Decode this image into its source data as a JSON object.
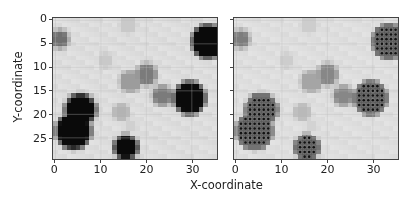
{
  "figure": {
    "xlabel": "X-coordinate",
    "ylabel": "Y-coordinate"
  },
  "chart_data": [
    {
      "type": "heatmap",
      "title": "",
      "xlabel": "X-coordinate",
      "ylabel": "Y-coordinate",
      "grid_shape": [
        30,
        36
      ],
      "xlim": [
        -0.5,
        35.5
      ],
      "ylim": [
        29.5,
        -0.5
      ],
      "xticks": [
        0,
        10,
        20,
        30
      ],
      "yticks": [
        0,
        5,
        10,
        15,
        20,
        25
      ],
      "colormap": "gray_r",
      "grid": true,
      "blobs": [
        {
          "x": 33.5,
          "y": 4.5,
          "radius": 3.0,
          "intensity": 1.0
        },
        {
          "x": 29.5,
          "y": 16.5,
          "radius": 2.9,
          "intensity": 1.0
        },
        {
          "x": 5.5,
          "y": 19.0,
          "radius": 2.8,
          "intensity": 1.0
        },
        {
          "x": 4.0,
          "y": 23.5,
          "radius": 3.3,
          "intensity": 1.0
        },
        {
          "x": 15.5,
          "y": 27.0,
          "radius": 2.0,
          "intensity": 1.0
        },
        {
          "x": 1.0,
          "y": 4.0,
          "radius": 1.3,
          "intensity": 0.55
        },
        {
          "x": 20.0,
          "y": 11.5,
          "radius": 1.7,
          "intensity": 0.5
        },
        {
          "x": 16.5,
          "y": 13.0,
          "radius": 1.8,
          "intensity": 0.35
        },
        {
          "x": 23.5,
          "y": 16.0,
          "radius": 1.6,
          "intensity": 0.5
        },
        {
          "x": 14.5,
          "y": 19.5,
          "radius": 1.4,
          "intensity": 0.25
        },
        {
          "x": 11.0,
          "y": 8.5,
          "radius": 1.3,
          "intensity": 0.15
        },
        {
          "x": 16.0,
          "y": 1.0,
          "radius": 1.5,
          "intensity": 0.15
        },
        {
          "x": 16.5,
          "y": 22.5,
          "radius": 1.0,
          "intensity": 0.12
        }
      ]
    },
    {
      "type": "heatmap",
      "title": "",
      "xlabel": "X-coordinate",
      "ylabel": "",
      "grid_shape": [
        30,
        36
      ],
      "xlim": [
        -0.5,
        35.5
      ],
      "ylim": [
        29.5,
        -0.5
      ],
      "xticks": [
        0,
        10,
        20,
        30
      ],
      "yticks": [
        0,
        5,
        10,
        15,
        20,
        25
      ],
      "ytick_labels_visible": false,
      "colormap": "gray_r (lightened)",
      "overlay": "dark dots marking high-value cells (threshold 0.55)",
      "grid": true
    }
  ],
  "left": {
    "xticks": [
      "0",
      "10",
      "20",
      "30"
    ],
    "yticks": [
      "0",
      "5",
      "10",
      "15",
      "20",
      "25"
    ]
  },
  "right": {
    "xticks": [
      "0",
      "10",
      "20",
      "30"
    ]
  },
  "colors": {
    "dark": "#0a0a0a",
    "background": "#e9e9e9",
    "dot": "#111111"
  }
}
